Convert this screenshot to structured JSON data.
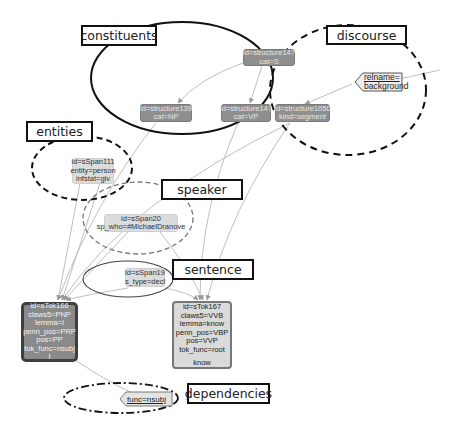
{
  "layers": {
    "constituents": "constituents",
    "discourse": "discourse",
    "entities": "entities",
    "speaker": "speaker",
    "sentence": "sentence",
    "dependencies": "dependencies"
  },
  "nodes": {
    "structure_s": {
      "line1": "id=structure14?",
      "line2": "cat=S"
    },
    "structure_np": {
      "line1": "id=structure139",
      "line2": "cat=NP"
    },
    "structure_vp": {
      "line1": "id=structure14?",
      "line2": "cat=VP"
    },
    "structure_seg": {
      "line1": "id=structure1050",
      "line2": "kind=segment"
    },
    "span_entity": {
      "line1": "id=sSpan111",
      "line2": "entity=person",
      "line3": "infstat=giv"
    },
    "span_speaker": {
      "line1": "id=sSpan20",
      "line2": "sp_who=#MichaelDranove"
    },
    "span_sentence": {
      "line1": "id=sSpan19",
      "line2": "s_type=decl"
    },
    "tok_166": {
      "lines": [
        "id=sTok166",
        "claws5=PNP",
        "lemma=I",
        "penn_pos=PRP",
        "pos=PP",
        "tok_func=nsubj"
      ],
      "text": "I"
    },
    "tok_167": {
      "lines": [
        "id=sTok167",
        "claws5=VVB",
        "lemma=know",
        "penn_pos=VBP",
        "pos=VVP",
        "tok_func=root"
      ],
      "text": "know"
    }
  },
  "edge_labels": {
    "discourse_rel": {
      "key": "relname=",
      "value": "background"
    },
    "dependency": {
      "key": "func=nsubj"
    }
  },
  "colors": {
    "structure_fill": "#8f8f8f",
    "span_fill": "#dcdcdc",
    "edge": "#b5b5b5",
    "outline": "#111111"
  }
}
